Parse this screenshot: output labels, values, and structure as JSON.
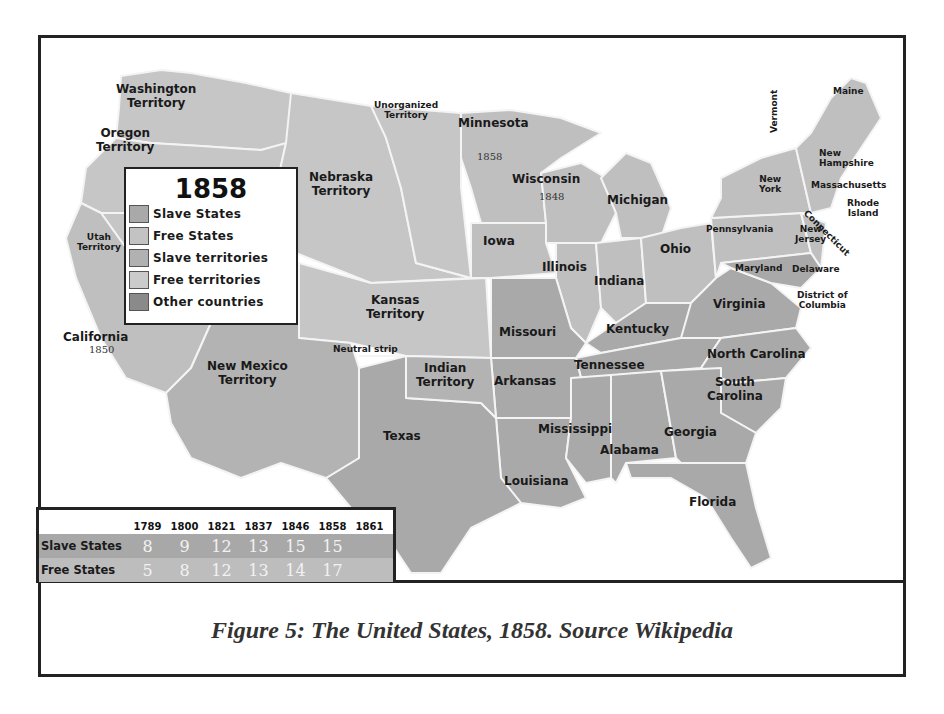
{
  "figure": {
    "caption": "Figure 5:  The United States, 1858.  Source Wikipedia"
  },
  "legend": {
    "title": "1858",
    "items": [
      {
        "label": "Slave States",
        "color": "#a9a9a9"
      },
      {
        "label": "Free States",
        "color": "#c3c3c3"
      },
      {
        "label": "Slave territories",
        "color": "#b1b1b1"
      },
      {
        "label": "Free territories",
        "color": "#cbcbcb"
      },
      {
        "label": "Other countries",
        "color": "#8a8a8a"
      }
    ]
  },
  "colors": {
    "slave_state": "#a9a9a9",
    "free_state": "#bfbfbf",
    "slave_territory": "#b3b3b3",
    "free_territory": "#c6c6c6",
    "water": "#ffffff",
    "border": "#f4f4f4"
  },
  "regions": {
    "washington": {
      "name": "Washington Territory",
      "l1": "Washington",
      "l2": "Territory"
    },
    "oregon": {
      "name": "Oregon Territory",
      "l1": "Oregon",
      "l2": "Territory"
    },
    "utah": {
      "name": "Utah Territory",
      "l1": "Utah",
      "l2": "Territory"
    },
    "california": {
      "name": "California",
      "year": "1850"
    },
    "nebraska": {
      "name": "Nebraska Territory",
      "l1": "Nebraska",
      "l2": "Territory"
    },
    "unorganized": {
      "name": "Unorganized Territory",
      "l1": "Unorganized",
      "l2": "Territory"
    },
    "minnesota": {
      "name": "Minnesota",
      "year": "1858"
    },
    "wisconsin": {
      "name": "Wisconsin",
      "year": "1848"
    },
    "michigan": {
      "name": "Michigan"
    },
    "iowa": {
      "name": "Iowa"
    },
    "illinois": {
      "name": "Illinois"
    },
    "indiana": {
      "name": "Indiana"
    },
    "ohio": {
      "name": "Ohio"
    },
    "kansas": {
      "name": "Kansas Territory",
      "l1": "Kansas",
      "l2": "Territory"
    },
    "missouri": {
      "name": "Missouri"
    },
    "neutral_strip": {
      "name": "Neutral strip"
    },
    "new_mexico": {
      "name": "New Mexico Territory",
      "l1": "New Mexico",
      "l2": "Territory"
    },
    "indian": {
      "name": "Indian Territory",
      "l1": "Indian",
      "l2": "Territory"
    },
    "texas": {
      "name": "Texas"
    },
    "arkansas": {
      "name": "Arkansas"
    },
    "louisiana": {
      "name": "Louisiana"
    },
    "mississippi": {
      "name": "Mississippi"
    },
    "alabama": {
      "name": "Alabama"
    },
    "georgia": {
      "name": "Georgia"
    },
    "florida": {
      "name": "Florida"
    },
    "tennessee": {
      "name": "Tennessee"
    },
    "kentucky": {
      "name": "Kentucky"
    },
    "virginia": {
      "name": "Virginia"
    },
    "north_carolina": {
      "name": "North Carolina"
    },
    "south_carolina": {
      "name": "South Carolina",
      "l1": "South",
      "l2": "Carolina"
    },
    "maryland": {
      "name": "Maryland"
    },
    "delaware": {
      "name": "Delaware"
    },
    "dc": {
      "name": "District of Columbia",
      "l1": "District of",
      "l2": "Columbia"
    },
    "pennsylvania": {
      "name": "Pennsylvania"
    },
    "new_jersey": {
      "name": "New Jersey",
      "l1": "New",
      "l2": "Jersey"
    },
    "new_york": {
      "name": "New York",
      "l1": "New",
      "l2": "York"
    },
    "connecticut": {
      "name": "Connecticut"
    },
    "rhode_island": {
      "name": "Rhode Island",
      "l1": "Rhode",
      "l2": "Island"
    },
    "massachusetts": {
      "name": "Massachusetts"
    },
    "vermont": {
      "name": "Vermont"
    },
    "new_hampshire": {
      "name": "New Hampshire",
      "l1": "New",
      "l2": "Hampshire"
    },
    "maine": {
      "name": "Maine"
    }
  },
  "state_count_table": {
    "years": [
      "1789",
      "1800",
      "1821",
      "1837",
      "1846",
      "1858",
      "1861"
    ],
    "rows": [
      {
        "label": "Slave States",
        "values": [
          "8",
          "9",
          "12",
          "13",
          "15",
          "15",
          ""
        ]
      },
      {
        "label": "Free States",
        "values": [
          "5",
          "8",
          "12",
          "13",
          "14",
          "17",
          ""
        ]
      }
    ]
  }
}
